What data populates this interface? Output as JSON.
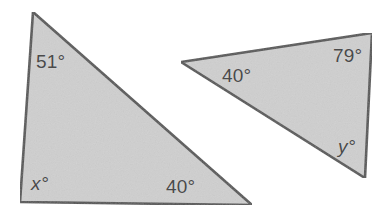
{
  "figure": {
    "background_color": "#ffffff",
    "fill_color": "#cfcfcf",
    "stroke_color": "#555555",
    "label_color": "#4a4a4a",
    "triangles": [
      {
        "name": "left-triangle",
        "points": "33,12 252,205 20,202",
        "angles": [
          {
            "id": "left-top",
            "text": "51°",
            "value": 51,
            "variable": false
          },
          {
            "id": "left-bottom-left",
            "text": "x°",
            "value": null,
            "variable": true
          },
          {
            "id": "left-bottom-right",
            "text": "40°",
            "value": 40,
            "variable": false
          }
        ]
      },
      {
        "name": "right-triangle",
        "points": "181,62 372,33 365,178",
        "angles": [
          {
            "id": "right-left",
            "text": "40°",
            "value": 40,
            "variable": false
          },
          {
            "id": "right-top",
            "text": "79°",
            "value": 79,
            "variable": false
          },
          {
            "id": "right-bottom",
            "text": "y°",
            "value": null,
            "variable": true
          }
        ]
      }
    ]
  },
  "labels": {
    "left_top": "51°",
    "left_bottom_left": "x°",
    "left_bottom_right": "40°",
    "right_left": "40°",
    "right_top": "79°",
    "right_bottom": "y°"
  }
}
